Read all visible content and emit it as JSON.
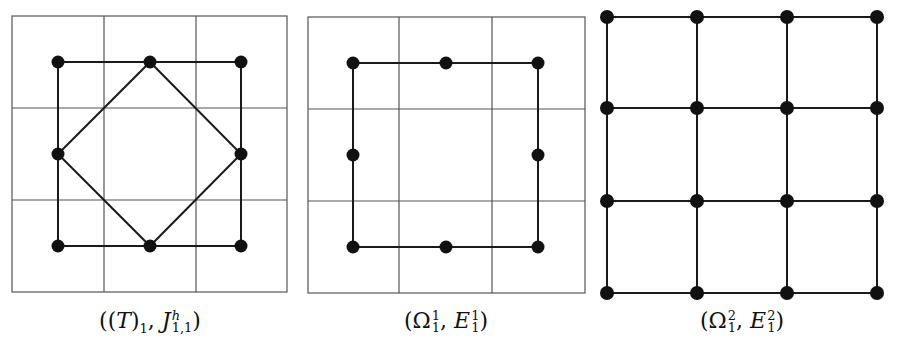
{
  "figure": {
    "panels": [
      {
        "id": "panel-1",
        "caption": {
          "open": "((",
          "T": "T",
          "close_t": ")",
          "t_sub": "1",
          "comma": ", ",
          "J": "J",
          "J_sup": "h",
          "J_sub": "1,1",
          "close": ")"
        },
        "background_grid": {
          "rows": 3,
          "cols": 3
        },
        "nodes": "3x3 ring (8 nodes, center empty)",
        "edges": [
          "outer square",
          "inner diamond connecting edge midpoints"
        ]
      },
      {
        "id": "panel-2",
        "caption": {
          "open": "(",
          "Omega": "Ω",
          "Omega_sup": "1",
          "Omega_sub": "1",
          "comma": ", ",
          "E": "E",
          "E_sup": "1",
          "E_sub": "1",
          "close": ")"
        },
        "background_grid": {
          "rows": 3,
          "cols": 3
        },
        "nodes": "3x3 ring (8 nodes, center empty)",
        "edges": [
          "outer square"
        ]
      },
      {
        "id": "panel-3",
        "caption": {
          "open": "(",
          "Omega": "Ω",
          "Omega_sup": "2",
          "Omega_sub": "1",
          "comma": ", ",
          "E": "E",
          "E_sup": "2",
          "E_sub": "1",
          "close": ")"
        },
        "background_grid": null,
        "nodes": "4x4 lattice (16 nodes)",
        "edges": [
          "full grid lattice"
        ]
      }
    ],
    "colors": {
      "grid": "#555555",
      "edge": "#1a1a1a",
      "node": "#111111",
      "background": "#ffffff"
    }
  }
}
